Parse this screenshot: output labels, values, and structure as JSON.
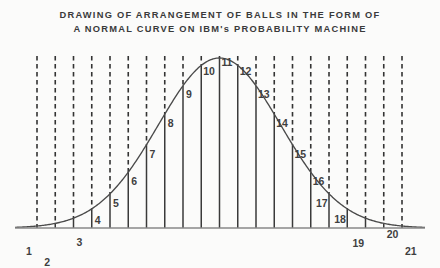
{
  "title": {
    "line1": "DRAWING OF ARRANGEMENT OF BALLS IN THE FORM OF",
    "line2": "A NORMAL CURVE ON IBM's PROBABILITY MACHINE"
  },
  "colors": {
    "background": "#fbfbfa",
    "ink": "#3a3a3a",
    "curve": "#4a4a4a",
    "baseline": "#888888",
    "dash": "#333333"
  },
  "chart_data": {
    "type": "bar",
    "title": "DRAWING OF ARRANGEMENT OF BALLS IN THE FORM OF A NORMAL CURVE ON IBM's PROBABILITY MACHINE",
    "xlabel": "",
    "ylabel": "",
    "grid": false,
    "legend": null,
    "xlim": [
      0,
      22
    ],
    "ylim": [
      0,
      1
    ],
    "note": "Column heights are normalized to the bell curve; value = height of the normal curve at each of the 21 bin centres, peak = 1.0 at column 11.",
    "categories": [
      "1",
      "2",
      "3",
      "4",
      "5",
      "6",
      "7",
      "8",
      "9",
      "10",
      "11",
      "12",
      "13",
      "14",
      "15",
      "16",
      "17",
      "18",
      "19",
      "20",
      "21"
    ],
    "values": [
      0.01,
      0.03,
      0.08,
      0.17,
      0.3,
      0.46,
      0.63,
      0.79,
      0.91,
      0.98,
      1.0,
      0.98,
      0.91,
      0.79,
      0.63,
      0.46,
      0.3,
      0.17,
      0.08,
      0.03,
      0.01
    ],
    "tick_labels": [
      "1",
      "2",
      "3",
      "4",
      "5",
      "6",
      "7",
      "8",
      "9",
      "10",
      "11",
      "12",
      "13",
      "14",
      "15",
      "16",
      "17",
      "18",
      "19",
      "20",
      "21"
    ],
    "label_offsets": [
      {
        "n": "1",
        "dx": -11,
        "dy": 30
      },
      {
        "n": "2",
        "dx": -11,
        "dy": 44
      },
      {
        "n": "3",
        "dx": 3,
        "dy": 29
      },
      {
        "n": "4",
        "dx": 3,
        "dy": 16
      },
      {
        "n": "5",
        "dx": 3,
        "dy": 14
      },
      {
        "n": "6",
        "dx": 3,
        "dy": 14
      },
      {
        "n": "7",
        "dx": 3,
        "dy": 14
      },
      {
        "n": "8",
        "dx": 3,
        "dy": 14
      },
      {
        "n": "9",
        "dx": 3,
        "dy": 13
      },
      {
        "n": "10",
        "dx": 2,
        "dy": 11
      },
      {
        "n": "11",
        "dx": 2,
        "dy": 9
      },
      {
        "n": "12",
        "dx": 2,
        "dy": 11
      },
      {
        "n": "13",
        "dx": 2,
        "dy": 13
      },
      {
        "n": "14",
        "dx": 2,
        "dy": 14
      },
      {
        "n": "15",
        "dx": 2,
        "dy": 14
      },
      {
        "n": "16",
        "dx": 2,
        "dy": 14
      },
      {
        "n": "17",
        "dx": -13,
        "dy": 14
      },
      {
        "n": "18",
        "dx": -13,
        "dy": 15
      },
      {
        "n": "19",
        "dx": -13,
        "dy": 30
      },
      {
        "n": "20",
        "dx": 3,
        "dy": 16
      },
      {
        "n": "21",
        "dx": 3,
        "dy": 30
      }
    ]
  },
  "geometry": {
    "first_col_x": 37,
    "col_spacing": 18.25,
    "baseline_y": 228,
    "peak_y": 58,
    "dash_top_y": 56,
    "axis_left_x": 15,
    "axis_right_x": 425
  }
}
